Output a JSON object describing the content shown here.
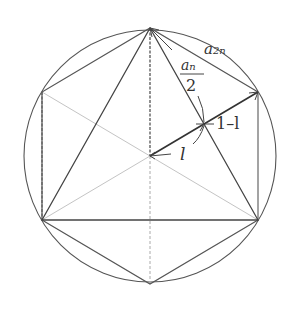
{
  "diagram": {
    "colors": {
      "background": "#ffffff",
      "stroke_dark": "#444444",
      "stroke_light": "#bbbbbb",
      "text": "#333333"
    },
    "circle": {
      "cx": 150,
      "cy": 156,
      "r": 126
    },
    "vertices": {
      "top": [
        150,
        28
      ],
      "upper_right": [
        258,
        92
      ],
      "lower_right": [
        258,
        220
      ],
      "bottom": [
        150,
        284
      ],
      "lower_left": [
        42,
        220
      ],
      "upper_left": [
        42,
        92
      ],
      "center": [
        150,
        156
      ],
      "intersection": [
        204,
        124
      ]
    },
    "labels": {
      "a2n_base": "a",
      "a2n_sub": "2n",
      "an_half_num_base": "a",
      "an_half_num_sub": "n",
      "an_half_den": "2",
      "one_minus_l": "1–l",
      "l": "l"
    }
  }
}
